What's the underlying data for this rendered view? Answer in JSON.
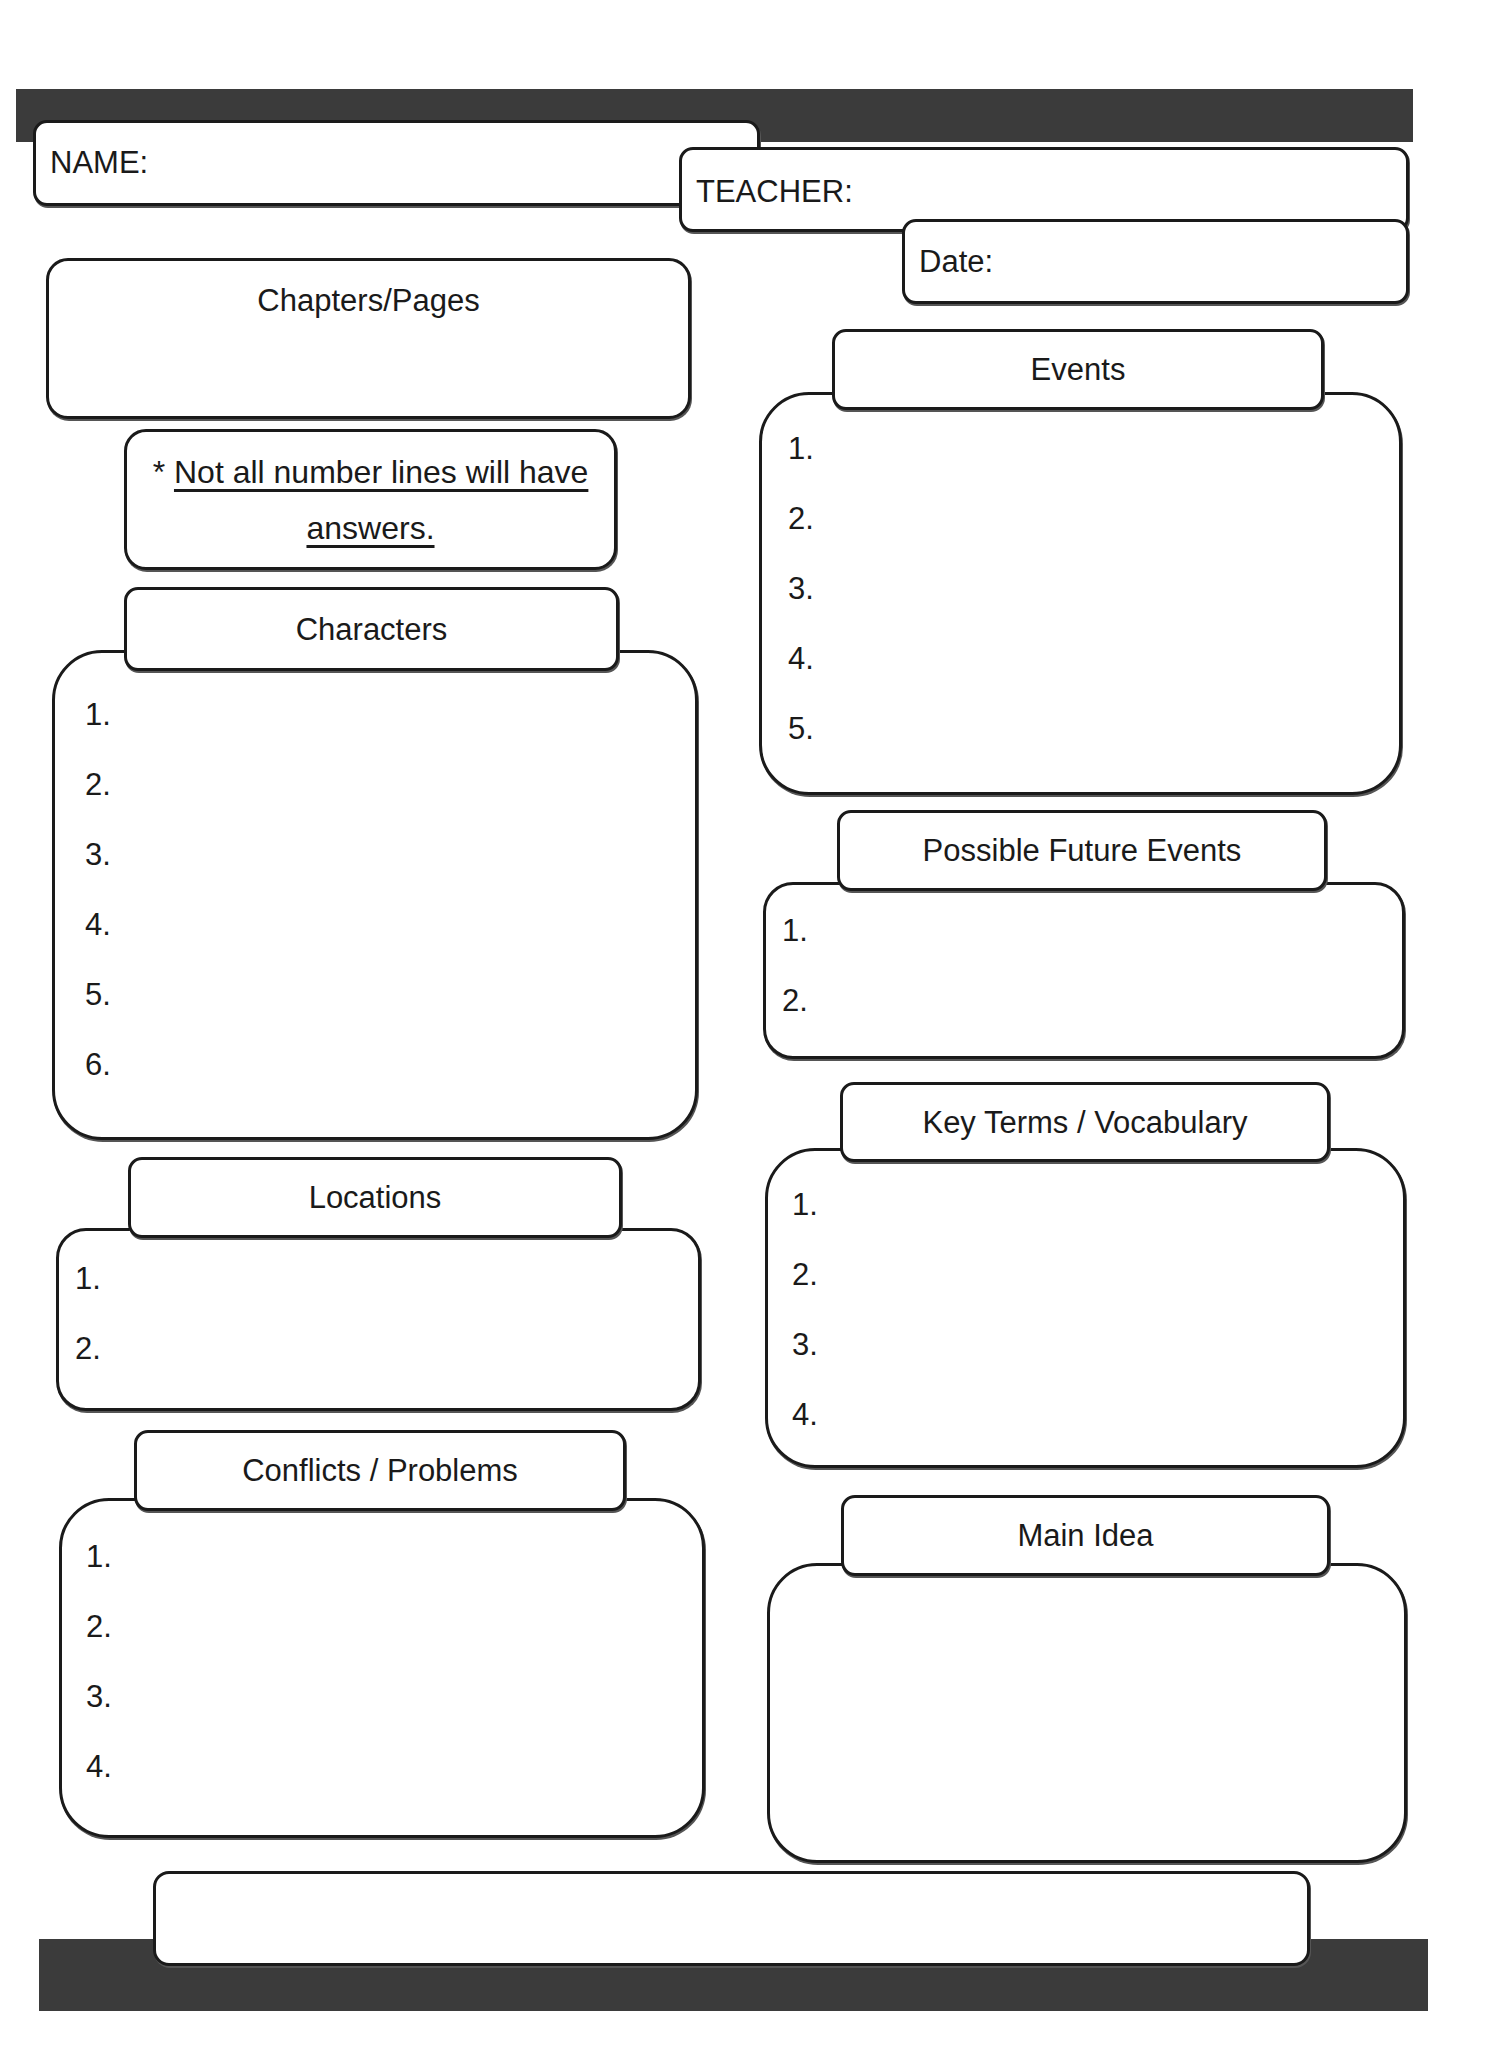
{
  "header": {
    "name_label": "NAME:",
    "teacher_label": "TEACHER:",
    "date_label": "Date:"
  },
  "chapters": {
    "label": "Chapters/Pages"
  },
  "note": {
    "asterisk": "*",
    "line1": "Not all number lines will have",
    "line2": "answers."
  },
  "sections": {
    "characters": {
      "title": "Characters",
      "items": [
        "1.",
        "2.",
        "3.",
        "4.",
        "5.",
        "6."
      ]
    },
    "locations": {
      "title": "Locations",
      "items": [
        "1.",
        "2."
      ]
    },
    "conflicts": {
      "title": "Conflicts / Problems",
      "items": [
        "1.",
        "2.",
        "3.",
        "4."
      ]
    },
    "events": {
      "title": "Events",
      "items": [
        "1.",
        "2.",
        "3.",
        "4.",
        "5."
      ]
    },
    "future_events": {
      "title": "Possible Future Events",
      "items": [
        "1.",
        "2."
      ]
    },
    "key_terms": {
      "title": "Key Terms / Vocabulary",
      "items": [
        "1.",
        "2.",
        "3.",
        "4."
      ]
    },
    "main_idea": {
      "title": "Main Idea"
    }
  },
  "colors": {
    "bar": "#3b3b3b",
    "border": "#1a1a1a",
    "paper": "#ffffff"
  }
}
